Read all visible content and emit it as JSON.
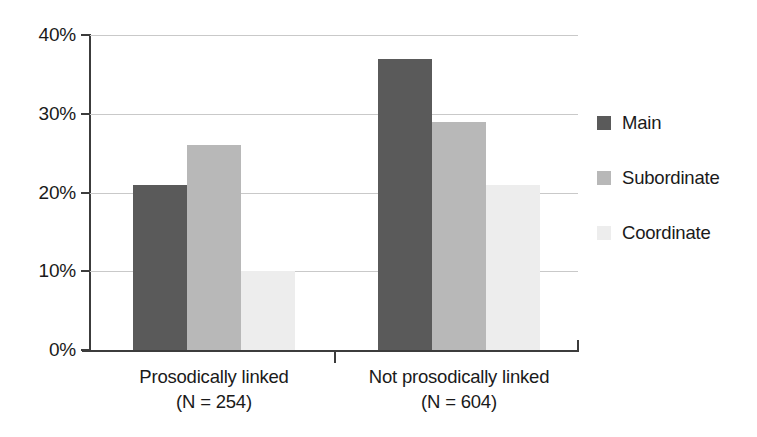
{
  "chart_data": {
    "type": "bar",
    "title": "",
    "xlabel": "",
    "ylabel": "",
    "ylim": [
      0,
      40
    ],
    "yunit": "%",
    "grid": true,
    "legend_position": "right",
    "categories": [
      "Prosodically linked",
      "Not prosodically linked"
    ],
    "category_sublabels": [
      "(N = 254)",
      "(N = 604)"
    ],
    "series": [
      {
        "name": "Main",
        "color": "#5a5a5a",
        "values": [
          21,
          37
        ]
      },
      {
        "name": "Subordinate",
        "color": "#b8b8b8",
        "values": [
          26,
          29
        ]
      },
      {
        "name": "Coordinate",
        "color": "#ededed",
        "values": [
          10,
          21
        ]
      }
    ],
    "y_ticks": [
      {
        "value": 40,
        "label": "40%"
      },
      {
        "value": 30,
        "label": "30%"
      },
      {
        "value": 20,
        "label": "20%"
      },
      {
        "value": 10,
        "label": "10%"
      },
      {
        "value": 0,
        "label": "0%"
      }
    ]
  },
  "legend": {
    "items": [
      {
        "label": "Main",
        "color": "#5a5a5a"
      },
      {
        "label": "Subordinate",
        "color": "#b8b8b8"
      },
      {
        "label": "Coordinate",
        "color": "#ededed"
      }
    ]
  },
  "axis": {
    "y_tick_labels": [
      "40%",
      "30%",
      "20%",
      "10%",
      "0%"
    ],
    "category_labels": [
      "Prosodically linked",
      "Not prosodically linked"
    ],
    "category_counts": [
      "(N = 254)",
      "(N = 604)"
    ]
  }
}
